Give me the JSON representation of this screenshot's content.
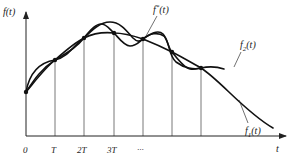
{
  "figure": {
    "axes": {
      "y_label": "f(t)",
      "x_label": "t"
    },
    "ticks": [
      {
        "label": "0"
      },
      {
        "label": "T"
      },
      {
        "label": "2T"
      },
      {
        "label": "3T"
      },
      {
        "label": "···"
      }
    ],
    "curves": [
      {
        "name": "f*(t)",
        "label_main": "f",
        "label_sup": "*",
        "label_arg": "(t)",
        "description": "oscillating interpolating curve"
      },
      {
        "name": "f2(t)",
        "label_main": "f",
        "label_sub": "2",
        "label_arg": "(t)",
        "description": "smooth curve through sample points, ending mid-right"
      },
      {
        "name": "f1(t)",
        "label_main": "f",
        "label_sub": "1",
        "label_arg": "(t)",
        "description": "smooth decaying curve through sample points"
      }
    ],
    "sample_points_count": 7,
    "colors": {
      "curve": "#111111",
      "axis": "#222222",
      "grid": "#555555",
      "background": "#ffffff"
    }
  }
}
